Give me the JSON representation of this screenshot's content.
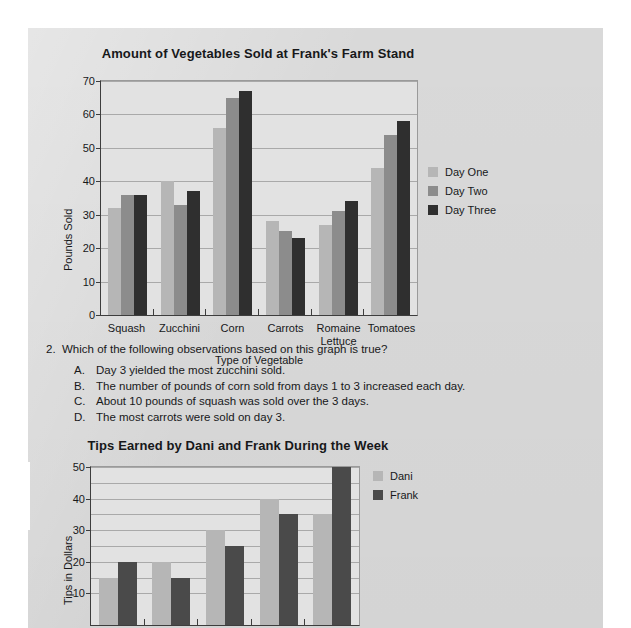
{
  "page": {
    "background_color": "#d9d9d9",
    "series_colors": {
      "light": "#b6b6b6",
      "medium": "#8c8c8c",
      "dark": "#2f2f2f"
    }
  },
  "question": {
    "number": "2.",
    "stem": "Which of the following observations based on this graph is true?",
    "choices": [
      {
        "letter": "A.",
        "text": "Day 3 yielded the most zucchini sold."
      },
      {
        "letter": "B.",
        "text": "The number of pounds of corn sold from days 1 to 3 increased each day."
      },
      {
        "letter": "C.",
        "text": "About 10 pounds of squash was sold over the 3 days."
      },
      {
        "letter": "D.",
        "text": "The most carrots were sold on day 3."
      }
    ]
  },
  "chart_data": [
    {
      "type": "bar",
      "title": "Amount of Vegetables Sold at Frank's Farm Stand",
      "xlabel": "Type of Vegetable",
      "ylabel": "Pounds Sold",
      "categories": [
        "Squash",
        "Zucchini",
        "Corn",
        "Carrots",
        "Romaine Lettuce",
        "Tomatoes"
      ],
      "yticks": [
        0,
        10,
        20,
        30,
        40,
        50,
        60,
        70
      ],
      "ylim": [
        0,
        70
      ],
      "grid": true,
      "legend_position": "right",
      "series": [
        {
          "name": "Day One",
          "color": "#b6b6b6",
          "values": [
            32,
            40,
            56,
            28,
            27,
            44
          ]
        },
        {
          "name": "Day Two",
          "color": "#8c8c8c",
          "values": [
            36,
            33,
            65,
            25,
            31,
            54
          ]
        },
        {
          "name": "Day Three",
          "color": "#2f2f2f",
          "values": [
            36,
            37,
            67,
            23,
            34,
            58
          ]
        }
      ]
    },
    {
      "type": "bar",
      "title": "Tips Earned by Dani and Frank During the Week",
      "xlabel": "",
      "ylabel": "Tips in Dollars",
      "categories": [
        "",
        "",
        "",
        "",
        ""
      ],
      "yticks": [
        10,
        20,
        30,
        40,
        50
      ],
      "ylim": [
        0,
        50
      ],
      "grid": true,
      "legend_position": "right",
      "note": "Chart is cropped at the bottom of the screenshot; x-axis category labels are not visible.",
      "series": [
        {
          "name": "Dani",
          "color": "#b6b6b6",
          "values": [
            15,
            20,
            30,
            40,
            35
          ]
        },
        {
          "name": "Frank",
          "color": "#4a4a4a",
          "values": [
            20,
            15,
            25,
            35,
            50
          ]
        }
      ]
    }
  ]
}
